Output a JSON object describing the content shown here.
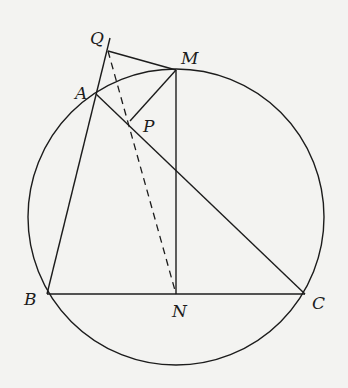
{
  "diagram": {
    "type": "geometry",
    "circle": {
      "cx": 176,
      "cy": 217,
      "r": 148
    },
    "points": {
      "Q": {
        "label": "Q",
        "x": 108,
        "y": 51
      },
      "M": {
        "label": "M",
        "x": 176,
        "y": 70
      },
      "A": {
        "label": "A",
        "x": 96,
        "y": 94
      },
      "P": {
        "label": "P",
        "x": 130,
        "y": 121
      },
      "B": {
        "label": "B",
        "x": 47,
        "y": 294
      },
      "N": {
        "label": "N",
        "x": 176,
        "y": 294
      },
      "C": {
        "label": "C",
        "x": 305,
        "y": 294
      }
    },
    "segments": [
      {
        "from": "B",
        "to": "C",
        "style": "solid"
      },
      {
        "from": "B",
        "to": "Q",
        "style": "solid",
        "extends_beyond": true
      },
      {
        "from": "A",
        "to": "C",
        "style": "solid"
      },
      {
        "from": "Q",
        "to": "M",
        "style": "solid"
      },
      {
        "from": "M",
        "to": "P",
        "style": "solid"
      },
      {
        "from": "M",
        "to": "N",
        "style": "solid"
      },
      {
        "from": "Q",
        "to": "N",
        "style": "dashed"
      }
    ],
    "colors": {
      "line": "#1c1c1c",
      "background": "#f3f3f1"
    }
  }
}
